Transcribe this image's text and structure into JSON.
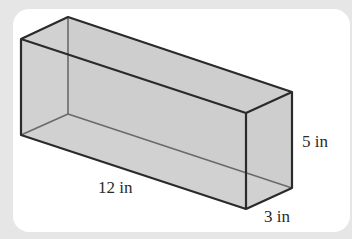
{
  "figure": {
    "shape": "rectangular-prism",
    "colors": {
      "background": "#e6e6e6",
      "panel": "#ffffff",
      "face_fill": "#c9c9c9",
      "edge": "#2a2a2a",
      "hidden_edge": "#6a6a6a"
    },
    "dimensions": {
      "length": {
        "label": "12 in",
        "value": 12,
        "unit": "in"
      },
      "height": {
        "label": "5 in",
        "value": 5,
        "unit": "in"
      },
      "width": {
        "label": "3 in",
        "value": 3,
        "unit": "in"
      }
    }
  }
}
